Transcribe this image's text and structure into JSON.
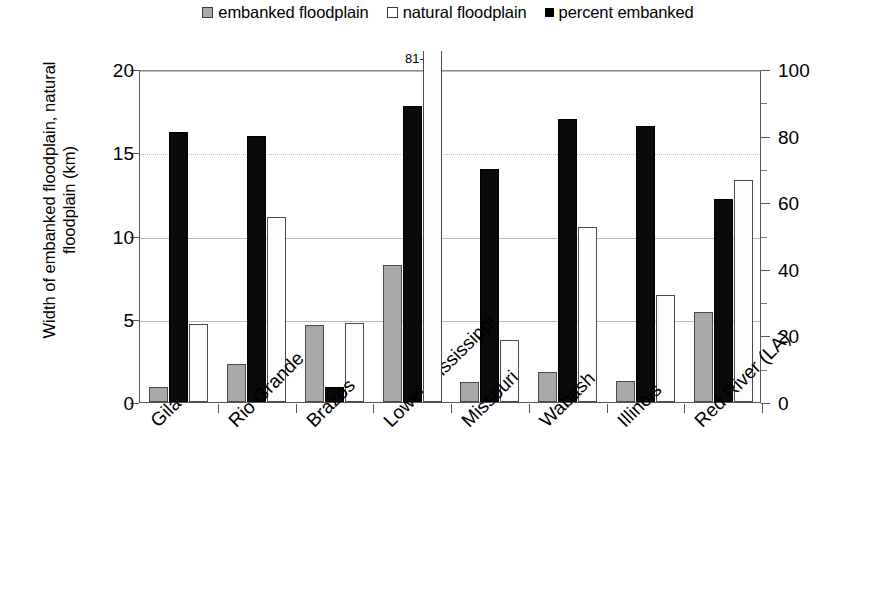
{
  "legend": {
    "items": [
      {
        "label": "embanked floodplain",
        "swatch": "gray-square-icon",
        "color": "#a9a9a9"
      },
      {
        "label": "natural floodplain",
        "swatch": "white-square-icon",
        "color": "#ffffff"
      },
      {
        "label": "percent embanked",
        "swatch": "black-square-icon",
        "color": "#000000"
      }
    ]
  },
  "axes": {
    "left_title": "Width of embanked floodplain, natural floodplain (km)",
    "right_title": "Percent embanked",
    "left_ticks": [
      "0",
      "5",
      "10",
      "15",
      "20"
    ],
    "right_ticks": [
      "0",
      "20",
      "40",
      "60",
      "80",
      "100"
    ]
  },
  "annotation": {
    "lower_mississippi_natural": "81-km"
  },
  "chart_data": {
    "type": "bar",
    "title": "",
    "xlabel": "",
    "ylabel": "Width of embanked floodplain, natural floodplain (km)",
    "ylabel_secondary": "Percent embanked",
    "ylim": [
      0,
      20
    ],
    "ylim_secondary": [
      0,
      100
    ],
    "yticks": [
      0,
      5,
      10,
      15,
      20
    ],
    "yticks_secondary": [
      0,
      20,
      40,
      60,
      80,
      100
    ],
    "grid": true,
    "legend_position": "top-center",
    "categories": [
      "Gila",
      "Rio Grande",
      "Brazos",
      "Lower Mississippi",
      "Missouri",
      "Wabash",
      "Illinois",
      "Red River (LA)"
    ],
    "series": [
      {
        "name": "embanked floodplain",
        "axis": "left",
        "unit": "km",
        "color": "#a9a9a9",
        "values": [
          0.9,
          2.3,
          4.6,
          8.2,
          1.2,
          1.8,
          1.25,
          5.4
        ]
      },
      {
        "name": "natural floodplain",
        "axis": "left",
        "unit": "km",
        "color": "#ffffff",
        "values": [
          4.7,
          11.1,
          4.75,
          81,
          3.75,
          10.5,
          6.4,
          13.35
        ],
        "clipped": [
          false,
          false,
          false,
          true,
          false,
          false,
          false,
          false
        ]
      },
      {
        "name": "percent embanked",
        "axis": "right",
        "unit": "%",
        "color": "#000000",
        "values": [
          81,
          80,
          4.5,
          89,
          70,
          85,
          83,
          61
        ]
      }
    ],
    "annotations": [
      {
        "category": "Lower Mississippi",
        "series": "natural floodplain",
        "text": "81-km"
      }
    ]
  }
}
